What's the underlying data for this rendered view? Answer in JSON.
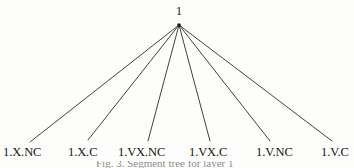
{
  "figure": {
    "type": "tree-diagram",
    "background_color": "#fdfdfc",
    "edge_color": "#2b2b2b",
    "text_color": "#15120f",
    "root": {
      "label": "1",
      "x": 179,
      "y": 11
    },
    "apex": {
      "x": 179,
      "y": 25
    },
    "leaves": [
      {
        "label": "1.X.NC",
        "label_x": 3,
        "label_y": 146,
        "edge_end_x": 30,
        "edge_end_y": 142
      },
      {
        "label": "1.X.C",
        "label_x": 68,
        "label_y": 146,
        "edge_end_x": 88,
        "edge_end_y": 140
      },
      {
        "label": "1.VX.NC",
        "label_x": 118,
        "label_y": 146,
        "edge_end_x": 148,
        "edge_end_y": 141
      },
      {
        "label": "1.VX.C",
        "label_x": 189,
        "label_y": 146,
        "edge_end_x": 210,
        "edge_end_y": 141
      },
      {
        "label": "1.V.NC",
        "label_x": 256,
        "label_y": 146,
        "edge_end_x": 270,
        "edge_end_y": 141
      },
      {
        "label": "1.V.C",
        "label_x": 321,
        "label_y": 146,
        "edge_end_x": 332,
        "edge_end_y": 141
      }
    ],
    "caption": {
      "text": "Fig. 3. Segment tree for layer 1",
      "clipped": true
    }
  }
}
